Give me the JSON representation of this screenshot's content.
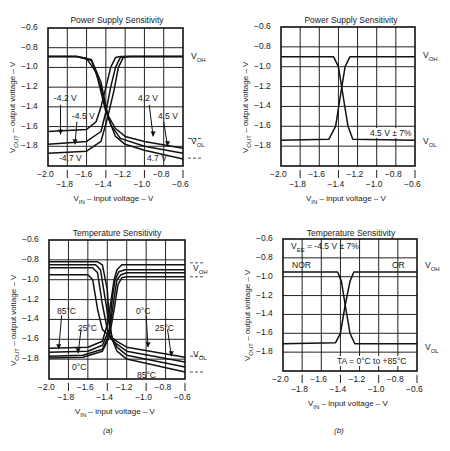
{
  "captions": {
    "a": "(a)",
    "b": "(b)"
  },
  "axis_text": {
    "ylabel_main": "V",
    "ylabel_sub": "OUT",
    "ylabel_rest": " – output voltage – V",
    "xlabel_main": "V",
    "xlabel_sub": "IN",
    "xlabel_rest": " – input voltage – V",
    "y_ticks": [
      "-0.6",
      "-0.8",
      "-1.0",
      "-1.2",
      "-1.4",
      "-1.6",
      "-1.8"
    ],
    "x_ticks_upper": [
      "-2.0",
      "-1.6",
      "-1.2",
      "-0.8"
    ],
    "x_ticks_lower": [
      "-1.8",
      "-1.4",
      "-1.0",
      "-0.6"
    ],
    "voh_main": "V",
    "voh_sub": "OH",
    "vol_main": "V",
    "vol_sub": "OL"
  },
  "panels": {
    "a_top": {
      "title": "Power Supply Sensitivity",
      "labels": {
        "l1": "-4.2 V",
        "l2": "-4.5 V",
        "l3": "-4.7 V",
        "r1": "4.2 V",
        "r2": "4.5 V",
        "r3": "4.7 V"
      }
    },
    "b_top": {
      "title": "Power Supply Sensitivity",
      "labels": {
        "note": "4.5 V ± 7%"
      }
    },
    "a_bottom": {
      "title": "Temperature Sensitivity",
      "labels": {
        "l1": "85°C",
        "l2": "25°C",
        "l3": "0°C",
        "r1": "0°C",
        "r2": "25°C",
        "r3": "85°C"
      }
    },
    "b_bottom": {
      "title": "Temperature Sensitivity",
      "labels": {
        "vee_main": "V",
        "vee_sub": "EE",
        "vee_rest": " = -4.5 V ± 7%",
        "nor": "NOR",
        "or": "OR",
        "ta": "TA = 0°C to +85°C"
      }
    }
  },
  "chart_data": [
    {
      "type": "line",
      "title": "Power Supply Sensitivity",
      "panel": "(a) top",
      "xlabel": "VIN – input voltage – V",
      "ylabel": "VOUT – output voltage – V",
      "xlim": [
        -2.0,
        -0.6
      ],
      "ylim": [
        -2.0,
        -0.6
      ],
      "grid": true,
      "x_ticks": [
        -2.0,
        -1.8,
        -1.6,
        -1.4,
        -1.2,
        -1.0,
        -0.8,
        -0.6
      ],
      "y_ticks": [
        -0.6,
        -0.8,
        -1.0,
        -1.2,
        -1.4,
        -1.6,
        -1.8
      ],
      "annotations": [
        "VOH",
        "VOL",
        "-4.2 V",
        "-4.5 V",
        "-4.7 V",
        "4.2 V",
        "4.5 V",
        "4.7 V"
      ],
      "series": [
        {
          "name": "NOR -4.2 V",
          "x": [
            -2.0,
            -1.7,
            -1.6,
            -1.5,
            -1.45,
            -1.4,
            -1.3,
            -1.2,
            -1.0,
            -0.6
          ],
          "y": [
            -0.89,
            -0.89,
            -0.91,
            -1.05,
            -1.25,
            -1.45,
            -1.62,
            -1.7,
            -1.75,
            -1.82
          ]
        },
        {
          "name": "NOR -4.5 V",
          "x": [
            -2.0,
            -1.7,
            -1.55,
            -1.45,
            -1.4,
            -1.35,
            -1.25,
            -1.0,
            -0.6
          ],
          "y": [
            -0.89,
            -0.89,
            -0.92,
            -1.15,
            -1.4,
            -1.58,
            -1.72,
            -1.8,
            -1.87
          ]
        },
        {
          "name": "NOR -4.7 V",
          "x": [
            -2.0,
            -1.7,
            -1.55,
            -1.45,
            -1.38,
            -1.3,
            -1.2,
            -1.0,
            -0.6
          ],
          "y": [
            -0.89,
            -0.89,
            -0.93,
            -1.2,
            -1.5,
            -1.7,
            -1.78,
            -1.84,
            -1.93
          ]
        },
        {
          "name": "OR -4.2 V",
          "x": [
            -2.0,
            -1.6,
            -1.5,
            -1.45,
            -1.4,
            -1.35,
            -1.3,
            -1.25,
            -0.6
          ],
          "y": [
            -1.65,
            -1.63,
            -1.55,
            -1.4,
            -1.2,
            -1.0,
            -0.9,
            -0.89,
            -0.89
          ]
        },
        {
          "name": "OR -4.5 V",
          "x": [
            -2.0,
            -1.6,
            -1.45,
            -1.4,
            -1.35,
            -1.3,
            -1.25,
            -1.2,
            -0.6
          ],
          "y": [
            -1.78,
            -1.75,
            -1.65,
            -1.45,
            -1.2,
            -1.0,
            -0.9,
            -0.89,
            -0.89
          ]
        },
        {
          "name": "OR -4.7 V",
          "x": [
            -2.0,
            -1.6,
            -1.45,
            -1.38,
            -1.32,
            -1.27,
            -1.22,
            -1.15,
            -0.6
          ],
          "y": [
            -1.87,
            -1.85,
            -1.75,
            -1.5,
            -1.25,
            -1.0,
            -0.9,
            -0.89,
            -0.89
          ]
        }
      ]
    },
    {
      "type": "line",
      "title": "Power Supply Sensitivity",
      "panel": "(b) top",
      "xlabel": "VIN – input voltage – V",
      "ylabel": "VOUT – output voltage – V",
      "xlim": [
        -2.0,
        -0.6
      ],
      "ylim": [
        -2.0,
        -0.6
      ],
      "grid": true,
      "annotations": [
        "VOH",
        "VOL",
        "4.5 V ± 7%"
      ],
      "series": [
        {
          "name": "NOR",
          "x": [
            -2.0,
            -1.45,
            -1.4,
            -1.35,
            -1.3,
            -1.25,
            -0.6
          ],
          "y": [
            -0.9,
            -0.9,
            -1.0,
            -1.3,
            -1.6,
            -1.73,
            -1.74
          ]
        },
        {
          "name": "OR",
          "x": [
            -2.0,
            -1.5,
            -1.43,
            -1.38,
            -1.33,
            -1.28,
            -0.6
          ],
          "y": [
            -1.74,
            -1.73,
            -1.6,
            -1.3,
            -1.0,
            -0.9,
            -0.9
          ]
        }
      ]
    },
    {
      "type": "line",
      "title": "Temperature Sensitivity",
      "panel": "(a) bottom",
      "xlabel": "VIN – input voltage – V",
      "ylabel": "VOUT – output voltage – V",
      "xlim": [
        -2.0,
        -0.6
      ],
      "ylim": [
        -2.0,
        -0.6
      ],
      "grid": true,
      "annotations": [
        "VOH",
        "VOL",
        "85°C",
        "25°C",
        "0°C",
        "0°C",
        "25°C",
        "85°C"
      ],
      "series": [
        {
          "name": "NOR 85°C",
          "x": [
            -2.0,
            -1.5,
            -1.45,
            -1.4,
            -1.38,
            -1.35,
            -1.3,
            -1.2,
            -0.6
          ],
          "y": [
            -0.82,
            -0.82,
            -0.85,
            -1.1,
            -1.4,
            -1.6,
            -1.72,
            -1.8,
            -1.93
          ]
        },
        {
          "name": "NOR 25°C",
          "x": [
            -2.0,
            -1.52,
            -1.47,
            -1.42,
            -1.38,
            -1.35,
            -1.3,
            -1.2,
            -0.6
          ],
          "y": [
            -0.85,
            -0.85,
            -0.9,
            -1.2,
            -1.45,
            -1.58,
            -1.68,
            -1.76,
            -1.88
          ]
        },
        {
          "name": "NOR 0°C",
          "x": [
            -2.0,
            -1.55,
            -1.5,
            -1.45,
            -1.4,
            -1.36,
            -1.3,
            -1.2,
            -0.6
          ],
          "y": [
            -0.88,
            -0.88,
            -0.93,
            -1.25,
            -1.5,
            -1.6,
            -1.65,
            -1.72,
            -1.83
          ]
        },
        {
          "name": "NOR extra",
          "x": [
            -2.0,
            -1.6,
            -1.55,
            -1.5,
            -1.45,
            -1.4,
            -1.3,
            -1.2,
            -0.6
          ],
          "y": [
            -0.95,
            -0.95,
            -1.0,
            -1.3,
            -1.5,
            -1.55,
            -1.62,
            -1.68,
            -1.78
          ]
        },
        {
          "name": "OR 85°C",
          "x": [
            -2.0,
            -1.6,
            -1.45,
            -1.4,
            -1.36,
            -1.33,
            -1.3,
            -1.25,
            -0.6
          ],
          "y": [
            -1.69,
            -1.68,
            -1.62,
            -1.45,
            -1.2,
            -1.0,
            -0.9,
            -0.85,
            -0.85
          ]
        },
        {
          "name": "OR 25°C",
          "x": [
            -2.0,
            -1.6,
            -1.45,
            -1.38,
            -1.35,
            -1.32,
            -1.28,
            -1.22,
            -0.6
          ],
          "y": [
            -1.73,
            -1.72,
            -1.66,
            -1.5,
            -1.2,
            -1.0,
            -0.92,
            -0.9,
            -0.9
          ]
        },
        {
          "name": "OR 0°C",
          "x": [
            -2.0,
            -1.65,
            -1.45,
            -1.38,
            -1.34,
            -1.3,
            -1.26,
            -1.2,
            -0.6
          ],
          "y": [
            -1.77,
            -1.76,
            -1.7,
            -1.55,
            -1.25,
            -1.0,
            -0.95,
            -0.93,
            -0.93
          ]
        },
        {
          "name": "OR extra",
          "x": [
            -2.0,
            -1.65,
            -1.45,
            -1.38,
            -1.33,
            -1.29,
            -1.25,
            -1.2,
            -0.6
          ],
          "y": [
            -1.79,
            -1.78,
            -1.72,
            -1.58,
            -1.3,
            -1.05,
            -0.98,
            -0.97,
            -0.97
          ]
        }
      ]
    },
    {
      "type": "line",
      "title": "Temperature Sensitivity",
      "panel": "(b) bottom",
      "xlabel": "VIN – input voltage – V",
      "ylabel": "VOUT – output voltage – V",
      "xlim": [
        -2.0,
        -0.6
      ],
      "ylim": [
        -2.0,
        -0.6
      ],
      "grid": true,
      "annotations": [
        "VEE = -4.5 V ± 7%",
        "NOR",
        "OR",
        "VOH",
        "VOL",
        "TA = 0°C to +85°C"
      ],
      "series": [
        {
          "name": "NOR",
          "x": [
            -2.0,
            -1.43,
            -1.39,
            -1.35,
            -1.3,
            -1.25,
            -0.6
          ],
          "y": [
            -0.95,
            -0.95,
            -1.05,
            -1.3,
            -1.6,
            -1.71,
            -1.71
          ]
        },
        {
          "name": "OR",
          "x": [
            -2.0,
            -1.45,
            -1.4,
            -1.35,
            -1.3,
            -1.26,
            -0.6
          ],
          "y": [
            -1.71,
            -1.7,
            -1.6,
            -1.3,
            -1.05,
            -0.95,
            -0.95
          ]
        }
      ]
    }
  ]
}
